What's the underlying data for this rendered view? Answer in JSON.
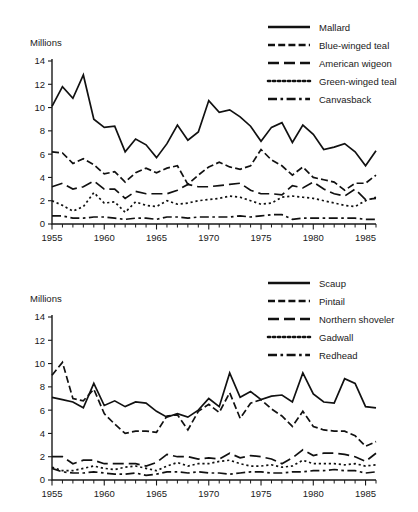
{
  "figure": {
    "panels": [
      {
        "id": "top",
        "ylabel": "Millions",
        "legend_position": "top-right",
        "legend": [
          {
            "label": "Mallard",
            "dash": "solid"
          },
          {
            "label": "Blue-winged teal",
            "dash": "dashed"
          },
          {
            "label": "American wigeon",
            "dash": "longdash"
          },
          {
            "label": "Green-winged teal",
            "dash": "dotted"
          },
          {
            "label": "Canvasback",
            "dash": "dashdot"
          }
        ]
      },
      {
        "id": "bottom",
        "ylabel": "Millions",
        "legend_position": "top-right",
        "legend": [
          {
            "label": "Scaup",
            "dash": "solid"
          },
          {
            "label": "Pintail",
            "dash": "dashed"
          },
          {
            "label": "Northern shoveler",
            "dash": "longdash"
          },
          {
            "label": "Gadwall",
            "dash": "dotted"
          },
          {
            "label": "Redhead",
            "dash": "dashdot"
          }
        ]
      }
    ]
  },
  "chart_data": [
    {
      "type": "line",
      "title": "",
      "xlabel": "",
      "ylabel": "Millions",
      "xlim": [
        1955,
        1986
      ],
      "ylim": [
        0,
        14
      ],
      "yticks": [
        0,
        2,
        4,
        6,
        8,
        10,
        12,
        14
      ],
      "xticks": [
        1955,
        1960,
        1965,
        1970,
        1975,
        1980,
        1985
      ],
      "xtick_minor_step": 1,
      "grid": false,
      "legend_position": "top-right",
      "x": [
        1955,
        1956,
        1957,
        1958,
        1959,
        1960,
        1961,
        1962,
        1963,
        1964,
        1965,
        1966,
        1967,
        1968,
        1969,
        1970,
        1971,
        1972,
        1973,
        1974,
        1975,
        1976,
        1977,
        1978,
        1979,
        1980,
        1981,
        1982,
        1983,
        1984,
        1985,
        1986
      ],
      "series": [
        {
          "name": "Mallard",
          "dash": "solid",
          "values": [
            10.1,
            11.8,
            10.8,
            12.8,
            9.0,
            8.3,
            8.4,
            6.2,
            7.3,
            6.8,
            5.7,
            6.9,
            8.5,
            7.2,
            7.9,
            10.6,
            9.6,
            9.8,
            9.2,
            8.4,
            7.1,
            8.3,
            8.7,
            7.0,
            8.5,
            7.7,
            6.4,
            6.6,
            6.9,
            6.2,
            5.0,
            6.3
          ]
        },
        {
          "name": "Blue-winged teal",
          "dash": "dashed",
          "values": [
            6.2,
            6.1,
            5.2,
            5.6,
            5.1,
            4.3,
            4.5,
            3.6,
            4.4,
            4.8,
            4.4,
            4.8,
            5.0,
            3.4,
            4.2,
            4.9,
            5.3,
            4.9,
            4.7,
            5.0,
            6.4,
            5.5,
            5.0,
            4.2,
            4.9,
            4.0,
            3.8,
            3.6,
            2.9,
            3.5,
            3.5,
            4.2
          ]
        },
        {
          "name": "American wigeon",
          "dash": "longdash",
          "values": [
            3.2,
            3.5,
            3.0,
            3.2,
            3.7,
            3.0,
            3.0,
            2.2,
            2.8,
            2.6,
            2.6,
            2.6,
            2.9,
            3.4,
            3.2,
            3.2,
            3.3,
            3.4,
            3.5,
            2.9,
            2.6,
            2.6,
            2.5,
            3.3,
            3.1,
            3.6,
            3.0,
            2.6,
            2.4,
            3.0,
            2.1,
            2.2
          ]
        },
        {
          "name": "Green-winged teal",
          "dash": "dotted",
          "values": [
            2.0,
            1.6,
            1.1,
            1.5,
            2.7,
            1.8,
            1.9,
            1.0,
            1.9,
            1.6,
            1.5,
            2.0,
            1.7,
            1.8,
            2.0,
            2.1,
            2.2,
            2.4,
            2.3,
            2.0,
            1.7,
            1.8,
            2.3,
            2.4,
            2.3,
            2.2,
            2.0,
            1.8,
            1.6,
            1.5,
            2.0,
            2.3
          ]
        },
        {
          "name": "Canvasback",
          "dash": "dashdot",
          "values": [
            0.7,
            0.7,
            0.5,
            0.5,
            0.6,
            0.6,
            0.5,
            0.4,
            0.5,
            0.5,
            0.4,
            0.6,
            0.6,
            0.5,
            0.6,
            0.6,
            0.6,
            0.6,
            0.7,
            0.6,
            0.7,
            0.8,
            0.8,
            0.4,
            0.5,
            0.5,
            0.5,
            0.5,
            0.5,
            0.5,
            0.4,
            0.4
          ]
        }
      ]
    },
    {
      "type": "line",
      "title": "",
      "xlabel": "",
      "ylabel": "Millions",
      "xlim": [
        1955,
        1986
      ],
      "ylim": [
        0,
        14
      ],
      "yticks": [
        0,
        2,
        4,
        6,
        8,
        10,
        12,
        14
      ],
      "xticks": [
        1955,
        1960,
        1965,
        1970,
        1975,
        1980,
        1985
      ],
      "xtick_minor_step": 1,
      "grid": false,
      "legend_position": "top-right",
      "x": [
        1955,
        1956,
        1957,
        1958,
        1959,
        1960,
        1961,
        1962,
        1963,
        1964,
        1965,
        1966,
        1967,
        1968,
        1969,
        1970,
        1971,
        1972,
        1973,
        1974,
        1975,
        1976,
        1977,
        1978,
        1979,
        1980,
        1981,
        1982,
        1983,
        1984,
        1985,
        1986
      ],
      "series": [
        {
          "name": "Scaup",
          "dash": "solid",
          "values": [
            7.1,
            6.9,
            6.7,
            6.2,
            8.3,
            6.4,
            6.8,
            6.3,
            6.7,
            6.6,
            5.9,
            5.4,
            5.7,
            5.4,
            6.0,
            7.0,
            6.3,
            9.2,
            7.1,
            7.6,
            6.9,
            7.2,
            7.3,
            6.7,
            9.2,
            7.4,
            6.7,
            6.6,
            8.7,
            8.3,
            6.3,
            6.2
          ]
        },
        {
          "name": "Pintail",
          "dash": "dashed",
          "values": [
            9.0,
            10.1,
            7.0,
            6.8,
            7.8,
            5.7,
            4.8,
            4.0,
            4.2,
            4.2,
            4.1,
            5.5,
            5.6,
            4.3,
            5.9,
            6.5,
            5.8,
            7.5,
            5.3,
            6.6,
            6.9,
            6.1,
            5.5,
            4.6,
            5.9,
            4.6,
            4.3,
            4.2,
            4.2,
            3.8,
            2.9,
            3.3
          ]
        },
        {
          "name": "Northern shoveler",
          "dash": "longdash",
          "values": [
            2.0,
            2.0,
            1.4,
            1.7,
            1.7,
            1.4,
            1.4,
            1.4,
            1.4,
            1.2,
            1.5,
            2.2,
            2.0,
            2.0,
            1.8,
            1.9,
            1.8,
            2.3,
            1.9,
            2.1,
            2.0,
            1.8,
            1.4,
            1.9,
            2.6,
            2.1,
            2.3,
            2.3,
            2.2,
            2.0,
            1.6,
            2.3
          ]
        },
        {
          "name": "Gadwall",
          "dash": "dotted",
          "values": [
            1.1,
            0.8,
            0.8,
            1.0,
            1.2,
            1.0,
            0.9,
            1.1,
            1.2,
            1.0,
            0.8,
            1.2,
            1.5,
            1.2,
            1.4,
            1.4,
            1.6,
            1.7,
            1.4,
            1.2,
            1.2,
            1.3,
            1.1,
            1.2,
            1.7,
            1.4,
            1.4,
            1.4,
            1.3,
            1.4,
            1.2,
            1.3
          ]
        },
        {
          "name": "Redhead",
          "dash": "dashdot",
          "values": [
            1.0,
            0.7,
            0.6,
            0.6,
            0.7,
            0.6,
            0.5,
            0.5,
            0.6,
            0.4,
            0.5,
            0.7,
            0.7,
            0.6,
            0.7,
            0.6,
            0.6,
            0.5,
            0.6,
            0.7,
            0.7,
            0.6,
            0.6,
            0.7,
            0.7,
            0.8,
            0.8,
            0.9,
            0.8,
            0.8,
            0.6,
            0.7
          ]
        }
      ]
    }
  ]
}
